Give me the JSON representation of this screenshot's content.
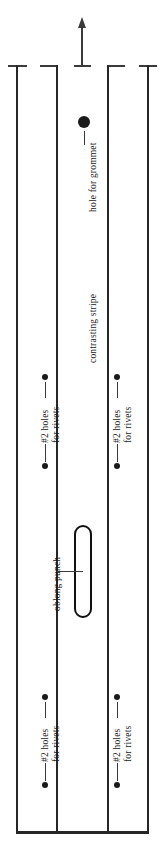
{
  "diagram": {
    "type": "technical-pattern-drawing",
    "ink_color": "#262626",
    "background_color": "#ffffff",
    "canvas": {
      "width": 164,
      "height": 850
    }
  },
  "grain_arrow": {
    "name": "grain-direction-arrow",
    "direction": "up",
    "center_x": 82,
    "tip_y": 17,
    "tail_y": 66
  },
  "panels": [
    {
      "id": "left-panel",
      "left_edge_x": 16,
      "right_edge_x": 57
    },
    {
      "id": "center-panel",
      "left_edge_x": 57,
      "right_edge_x": 108
    },
    {
      "id": "right-panel",
      "left_edge_x": 108,
      "right_edge_x": 148
    }
  ],
  "features": {
    "grommet_hole": {
      "label": "hole for grommet",
      "cx": 84,
      "cy": 122,
      "diameter": 12
    },
    "contrasting_stripe": {
      "label": "contrasting stripe"
    },
    "oblong_punch": {
      "label": "oblong punch",
      "x": 74,
      "y": 525,
      "width": 18,
      "height": 93
    },
    "rivet_holes": [
      {
        "label_line1": "#2 holes",
        "label_line2": "for rivets",
        "panel": "left-panel",
        "cx": 45,
        "top_dot_cy": 377,
        "bottom_dot_cy": 466,
        "diameter": 6
      },
      {
        "label_line1": "#2 holes",
        "label_line2": "for rivets",
        "panel": "right-panel",
        "cx": 117,
        "top_dot_cy": 377,
        "bottom_dot_cy": 466,
        "diameter": 6
      },
      {
        "label_line1": "#2 holes",
        "label_line2": "for rivets",
        "panel": "left-panel",
        "cx": 45,
        "top_dot_cy": 697,
        "bottom_dot_cy": 785,
        "diameter": 6
      },
      {
        "label_line1": "#2 holes",
        "label_line2": "for rivets",
        "panel": "right-panel",
        "cx": 117,
        "top_dot_cy": 697,
        "bottom_dot_cy": 785,
        "diameter": 6
      }
    ]
  }
}
